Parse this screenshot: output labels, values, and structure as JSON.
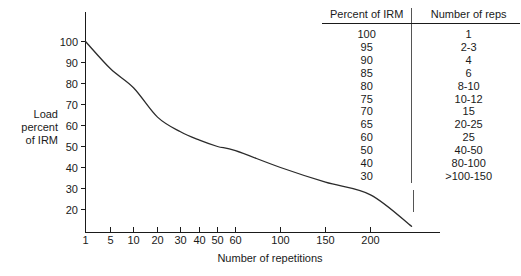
{
  "chart_data": {
    "type": "line",
    "title": "",
    "xlabel": "Number of repetitions",
    "ylabel": "Load\npercent\nof IRM",
    "ylabel_lines": [
      "Load",
      "percent",
      "of IRM"
    ],
    "xtick_labels": [
      "1",
      "5",
      "10",
      "20",
      "30",
      "40",
      "50",
      "60",
      "100",
      "150",
      "200"
    ],
    "xtick_values": [
      1,
      5,
      10,
      20,
      30,
      40,
      50,
      60,
      100,
      150,
      200
    ],
    "ytick_labels": [
      "100",
      "90",
      "80",
      "70",
      "60",
      "50",
      "40",
      "30",
      "20"
    ],
    "ytick_values": [
      100,
      90,
      80,
      70,
      60,
      50,
      40,
      30,
      20
    ],
    "ylim": [
      10,
      104
    ],
    "xlim": [
      1,
      260
    ],
    "grid": false,
    "legend": "none",
    "x_scale": "log-like",
    "series": [
      {
        "name": "Load percent of 1RM vs repetitions",
        "x": [
          1,
          5,
          10,
          20,
          30,
          40,
          50,
          60,
          100,
          150,
          200,
          260
        ],
        "y": [
          100,
          87,
          78,
          64,
          57,
          53,
          50,
          48,
          40,
          33,
          27,
          12
        ]
      }
    ]
  },
  "table": {
    "headers": [
      "Percent of IRM",
      "Number of reps"
    ],
    "rows": [
      [
        "100",
        "1"
      ],
      [
        "95",
        "2-3"
      ],
      [
        "90",
        "4"
      ],
      [
        "85",
        "6"
      ],
      [
        "80",
        "8-10"
      ],
      [
        "75",
        "10-12"
      ],
      [
        "70",
        "15"
      ],
      [
        "65",
        "20-25"
      ],
      [
        "60",
        "25"
      ],
      [
        "50",
        "40-50"
      ],
      [
        "40",
        "80-100"
      ],
      [
        "30",
        ">100-150"
      ]
    ]
  },
  "colors": {
    "curve": "#2b2b2b",
    "axis": "#1a1a1a",
    "text": "#1a1a1a",
    "divider": "#555555",
    "background": "#ffffff"
  }
}
